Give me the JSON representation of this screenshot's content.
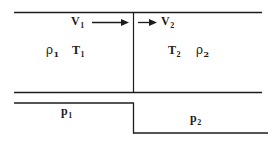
{
  "figure": {
    "background_color": "#ffffff",
    "line_color": "#1c1c1c",
    "labels": {
      "velocity_upstream": "V",
      "velocity_upstream_sub": "1",
      "velocity_downstream": "V",
      "velocity_downstream_sub": "2",
      "density_upstream": "ρ",
      "density_upstream_sub": "1",
      "temperature_upstream": "T",
      "temperature_upstream_sub": "1",
      "temperature_downstream": "T",
      "temperature_downstream_sub": "2",
      "density_downstream": "ρ",
      "density_downstream_sub": "2",
      "pressure_upstream": "p",
      "pressure_upstream_sub": "1",
      "pressure_downstream": "p",
      "pressure_downstream_sub": "2"
    },
    "geometry": {
      "duct_top_y": 12,
      "duct_bottom_y": 93,
      "duct_left_x": 14,
      "duct_right_x": 262,
      "divider_x": 133.5,
      "pressure_upstream_line_y": 103,
      "pressure_downstream_line_y": 133,
      "pressure_step_x": 133.5,
      "arrow_upstream": {
        "x1": 92,
        "x2": 128,
        "y": 22
      },
      "arrow_downstream": {
        "x1": 138,
        "x2": 157,
        "y": 22
      }
    }
  }
}
